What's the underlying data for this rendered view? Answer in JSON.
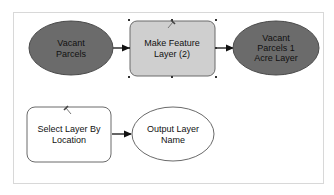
{
  "diagram": {
    "type": "model-builder",
    "colors": {
      "dataset_fill": "#6b6b6b",
      "tool_fill": "#cfcfcf",
      "blank_fill": "#ffffff",
      "stroke": "#555555",
      "connector": "#111111",
      "frame": "#d8d8d8"
    },
    "nodes": [
      {
        "id": "vacant-parcels",
        "shape": "ellipse",
        "lines": [
          "Vacant",
          "Parcels"
        ]
      },
      {
        "id": "make-feature-layer",
        "shape": "rounded-rect",
        "selected": true,
        "lines": [
          "Make Feature",
          "Layer (2)"
        ]
      },
      {
        "id": "vacant-parcels-1-acre",
        "shape": "ellipse",
        "lines": [
          "Vacant",
          "Parcels 1",
          "Acre Layer"
        ]
      },
      {
        "id": "select-layer-by-location",
        "shape": "rounded-rect",
        "lines": [
          "Select Layer By",
          "Location"
        ]
      },
      {
        "id": "output-layer-name",
        "shape": "ellipse",
        "lines": [
          "Output Layer",
          "Name"
        ]
      }
    ],
    "edges": [
      {
        "from": "vacant-parcels",
        "to": "make-feature-layer"
      },
      {
        "from": "make-feature-layer",
        "to": "vacant-parcels-1-acre"
      },
      {
        "from": "select-layer-by-location",
        "to": "output-layer-name"
      }
    ]
  }
}
